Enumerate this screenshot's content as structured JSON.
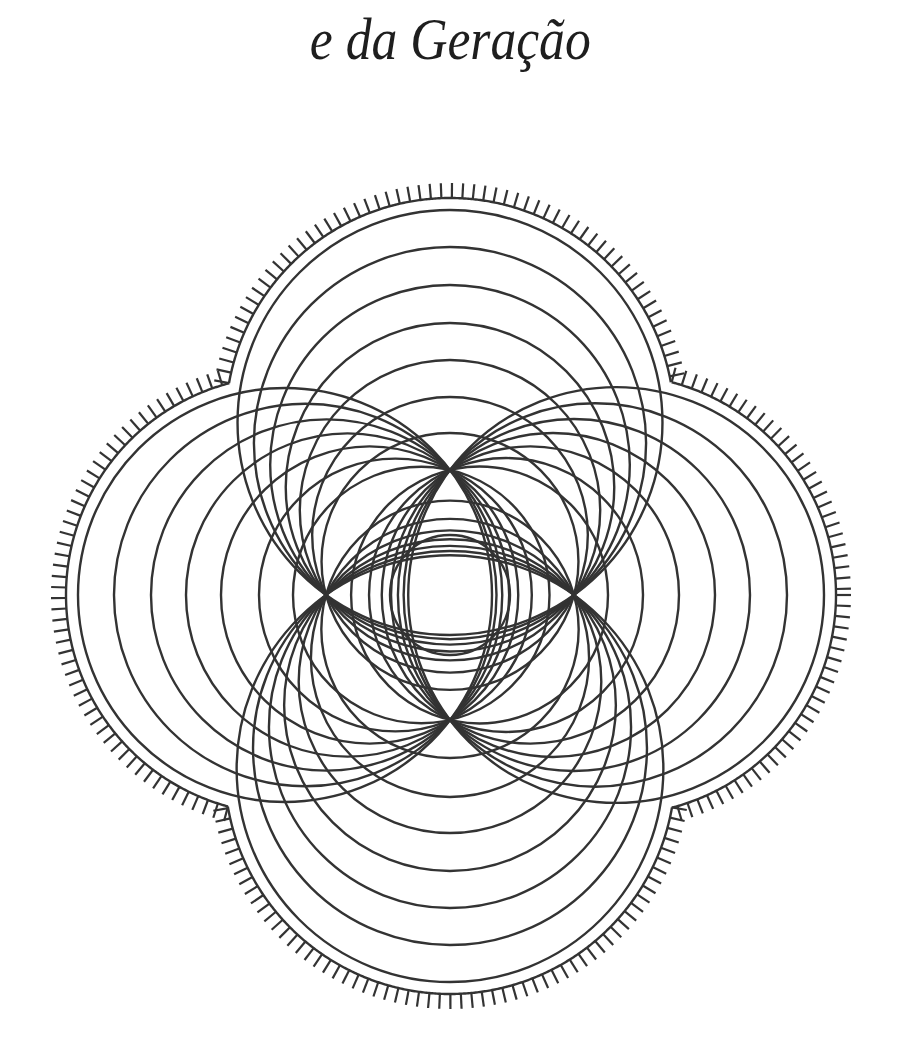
{
  "page": {
    "title": "e da Geração"
  },
  "figure": {
    "stroke_color": "#333333",
    "stroke_width": 2.4,
    "center": {
      "x": 450,
      "y": 595
    },
    "center_circle_radius": 60,
    "pinch_distance": {
      "horizontal": 124,
      "vertical": 125
    },
    "lobes": [
      {
        "name": "top",
        "axis": "up",
        "far_distances": [
          162,
          198,
          235,
          272,
          310,
          348,
          385
        ]
      },
      {
        "name": "bottom",
        "axis": "down",
        "far_distances": [
          163,
          202,
          238,
          276,
          313,
          350,
          387
        ]
      },
      {
        "name": "left",
        "axis": "left",
        "far_distances": [
          157,
          191,
          229,
          264,
          299,
          336,
          372
        ]
      },
      {
        "name": "right",
        "axis": "right",
        "far_distances": [
          158,
          193,
          229,
          265,
          300,
          337,
          374
        ]
      }
    ],
    "hatched_boundary": {
      "offset": 12,
      "tick_length": 15,
      "tick_spacing": 9.5
    }
  }
}
